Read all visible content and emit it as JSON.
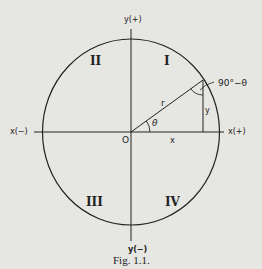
{
  "figure": {
    "caption": "Fig. 1.1.",
    "axes": {
      "x_pos_label": "x(+)",
      "x_neg_label": "x(−)",
      "y_pos_label": "y(+)",
      "y_neg_label": "y(−)",
      "origin_label": "O"
    },
    "quadrants": [
      "I",
      "II",
      "III",
      "IV"
    ],
    "triangle": {
      "hypotenuse_label": "r",
      "adjacent_label": "x",
      "opposite_label": "y",
      "angle_label": "θ",
      "complement_label": "90°−θ"
    },
    "colors": {
      "background": "#e6e6e2",
      "ink": "#222222"
    }
  }
}
